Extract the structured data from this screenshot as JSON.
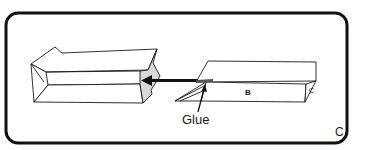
{
  "figure": {
    "panel_label": "C",
    "labels": {
      "glue": "Glue",
      "face_b": "B",
      "end_mark": "C"
    },
    "colors": {
      "line": "#1a1a1a",
      "frame": "#111111",
      "shaded_face": "#d9d9d9",
      "background": "#ffffff"
    }
  }
}
